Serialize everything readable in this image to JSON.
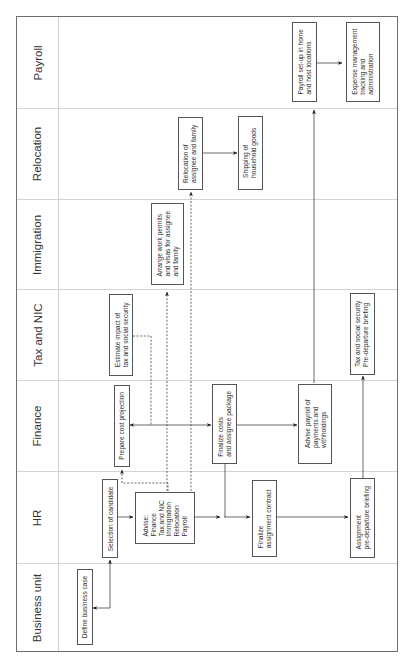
{
  "diagram": {
    "orientation": "rotated-90-ccw",
    "lanes": [
      {
        "id": "payroll",
        "label": "Payroll"
      },
      {
        "id": "relocation",
        "label": "Relocation"
      },
      {
        "id": "immigration",
        "label": "Immigration"
      },
      {
        "id": "tax",
        "label": "Tax and NIC"
      },
      {
        "id": "finance",
        "label": "Finance"
      },
      {
        "id": "hr",
        "label": "HR"
      },
      {
        "id": "business",
        "label": "Business unit"
      }
    ],
    "nodes": {
      "define_business_case": {
        "lane": "business",
        "text": "Define business case"
      },
      "selection_of_candidate": {
        "lane": "hr",
        "text": "Selection of candidate"
      },
      "advise": {
        "lane": "hr",
        "text": "Advise:\nFinance\nTax and NIC\nImmigration\nRelocation\nPayroll"
      },
      "finalize_contract": {
        "lane": "hr",
        "text": "Finalize\nassignment contract"
      },
      "assignment_briefing": {
        "lane": "hr",
        "text": "Assignment\npre-departure briefing"
      },
      "prepare_cost_projection": {
        "lane": "finance",
        "text": "Prepare cost projection"
      },
      "finalize_costs": {
        "lane": "finance",
        "text": "Finalize costs\nand assignee package"
      },
      "advise_payroll": {
        "lane": "finance",
        "text": "Advise payroll of\npayments and\nwithholdings"
      },
      "estimate_tax": {
        "lane": "tax",
        "text": "Estimate impact of\ntax and social security"
      },
      "tax_briefing": {
        "lane": "tax",
        "text": "Tax and social security\nPre-departure briefing"
      },
      "work_permits": {
        "lane": "immigration",
        "text": "Arrange work permits\nand visas for assignee\nand family"
      },
      "relocation_family": {
        "lane": "relocation",
        "text": "Relocation of\nassignee and family"
      },
      "shipping_goods": {
        "lane": "relocation",
        "text": "Shipping of\nhousehold goods"
      },
      "payroll_setup": {
        "lane": "payroll",
        "text": "Payroll set-up in home\nand host locations"
      },
      "expense_management": {
        "lane": "payroll",
        "text": "Expense management\ntracking and\nadministration"
      }
    },
    "edges": [
      {
        "from": "define_business_case",
        "to": "selection_of_candidate",
        "style": "solid",
        "bidirectional": true
      },
      {
        "from": "selection_of_candidate",
        "to": "advise",
        "style": "solid"
      },
      {
        "from": "advise",
        "to": "prepare_cost_projection",
        "style": "dashed"
      },
      {
        "from": "estimate_tax",
        "to": "prepare_cost_projection",
        "style": "dashed"
      },
      {
        "from": "advise",
        "to": "work_permits",
        "style": "dashed"
      },
      {
        "from": "advise",
        "to": "relocation_family",
        "style": "dashed"
      },
      {
        "from": "prepare_cost_projection",
        "to": "finalize_costs",
        "style": "solid",
        "bidirectional": true
      },
      {
        "from": "advise",
        "to": "finalize_contract",
        "style": "solid"
      },
      {
        "from": "finalize_costs",
        "to": "finalize_contract",
        "style": "solid"
      },
      {
        "from": "finalize_costs",
        "to": "advise_payroll",
        "style": "solid"
      },
      {
        "from": "finalize_contract",
        "to": "assignment_briefing",
        "style": "solid"
      },
      {
        "from": "assignment_briefing",
        "to": "tax_briefing",
        "style": "solid"
      },
      {
        "from": "advise_payroll",
        "to": "payroll_setup",
        "style": "solid"
      },
      {
        "from": "payroll_setup",
        "to": "expense_management",
        "style": "solid"
      },
      {
        "from": "relocation_family",
        "to": "shipping_goods",
        "style": "solid"
      }
    ]
  }
}
